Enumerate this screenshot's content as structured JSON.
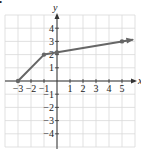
{
  "chart_data": {
    "type": "line",
    "title": "",
    "xlabel": "x",
    "ylabel": "y",
    "xlim": [
      -4,
      6
    ],
    "ylim": [
      -5,
      5
    ],
    "grid": true,
    "x_ticks": [
      -3,
      -2,
      -1,
      1,
      2,
      3,
      4,
      5
    ],
    "x_tick_labels": [
      "−3",
      "−2",
      "−1",
      "1",
      "2",
      "3",
      "4",
      "5"
    ],
    "y_ticks": [
      -4,
      -3,
      -2,
      -1,
      1,
      2,
      3,
      4
    ],
    "y_tick_labels": [
      "−4",
      "−3",
      "−2",
      "−1",
      "1",
      "2",
      "3",
      "4"
    ],
    "series": [
      {
        "name": "piecewise",
        "x": [
          -3,
          -1,
          5,
          5.8
        ],
        "y": [
          0,
          2,
          3,
          3.13
        ],
        "points_marked": [
          [
            -3,
            0
          ],
          [
            -1,
            2
          ],
          [
            0,
            2.17
          ],
          [
            5,
            3
          ]
        ],
        "end_arrow": true,
        "color": "#666666"
      }
    ]
  },
  "marker": "•",
  "colors": {
    "line": "#666666",
    "axis": "#333333",
    "grid": "#d9d9d9"
  }
}
